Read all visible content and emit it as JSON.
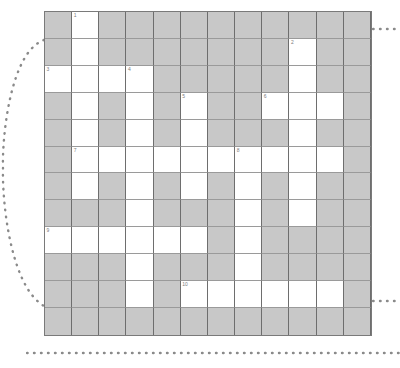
{
  "puzzle": {
    "type": "crossword-grid",
    "rows": 12,
    "columns": 12,
    "colors": {
      "block_fill": "#c8c8c8",
      "open_fill": "#ffffff",
      "grid_line": "#9a9a9a",
      "border": "#7a7a7a",
      "number_text": "#7d7d7d",
      "dots": "#8a8a8a"
    },
    "legend": {
      "open_label": "open cell",
      "block_label": "blocked cell"
    },
    "clue_numbers": [
      {
        "number": "1",
        "row": 1,
        "col": 2
      },
      {
        "number": "2",
        "row": 2,
        "col": 10
      },
      {
        "number": "3",
        "row": 3,
        "col": 1
      },
      {
        "number": "4",
        "row": 3,
        "col": 4
      },
      {
        "number": "5",
        "row": 4,
        "col": 6
      },
      {
        "number": "6",
        "row": 4,
        "col": 9
      },
      {
        "number": "7",
        "row": 6,
        "col": 2
      },
      {
        "number": "8",
        "row": 6,
        "col": 8
      },
      {
        "number": "9",
        "row": 9,
        "col": 1
      },
      {
        "number": "10",
        "row": 11,
        "col": 6
      }
    ],
    "open_cells": [
      [
        0,
        1,
        0,
        0,
        0,
        0,
        0,
        0,
        0,
        0,
        0,
        0
      ],
      [
        0,
        1,
        0,
        0,
        0,
        0,
        0,
        0,
        0,
        1,
        0,
        0
      ],
      [
        1,
        1,
        1,
        1,
        0,
        0,
        0,
        0,
        0,
        1,
        0,
        0
      ],
      [
        0,
        1,
        0,
        1,
        0,
        1,
        0,
        0,
        1,
        1,
        1,
        0
      ],
      [
        0,
        1,
        0,
        1,
        0,
        1,
        0,
        0,
        0,
        1,
        0,
        0
      ],
      [
        0,
        1,
        1,
        1,
        1,
        1,
        1,
        1,
        1,
        1,
        1,
        0
      ],
      [
        0,
        1,
        0,
        1,
        0,
        1,
        0,
        1,
        0,
        1,
        0,
        0
      ],
      [
        0,
        0,
        0,
        1,
        0,
        0,
        0,
        1,
        0,
        1,
        0,
        0
      ],
      [
        1,
        1,
        1,
        1,
        1,
        1,
        0,
        1,
        0,
        0,
        0,
        0
      ],
      [
        0,
        0,
        0,
        1,
        0,
        0,
        0,
        1,
        0,
        0,
        0,
        0
      ],
      [
        0,
        0,
        0,
        1,
        0,
        1,
        1,
        1,
        1,
        1,
        1,
        0
      ],
      [
        0,
        0,
        0,
        0,
        0,
        0,
        0,
        0,
        0,
        0,
        0,
        0
      ]
    ]
  },
  "decorations": {
    "left_arc_label": "dotted-arc-left",
    "top_right_label": "dotted-line-top-right",
    "mid_right_label": "dotted-line-mid-right",
    "bottom_label": "dotted-line-bottom"
  }
}
